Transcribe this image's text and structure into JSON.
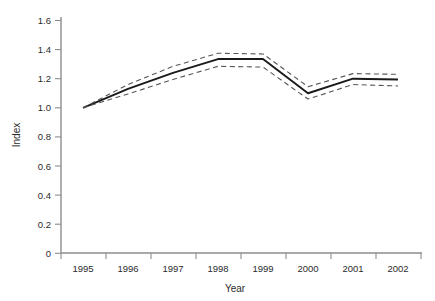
{
  "chart_data": {
    "type": "line",
    "title": "",
    "xlabel": "Year",
    "ylabel": "Index",
    "categories": [
      "1995",
      "1996",
      "1997",
      "1998",
      "1999",
      "2000",
      "2001",
      "2002"
    ],
    "x": [
      1995,
      1996,
      1997,
      1998,
      1999,
      2000,
      2001,
      2002
    ],
    "ylim": [
      0,
      1.6
    ],
    "yticks": [
      "0",
      "0.2",
      "0.4",
      "0.6",
      "0.8",
      "1.0",
      "1.2",
      "1.4",
      "1.6"
    ],
    "ytick_values": [
      0,
      0.2,
      0.4,
      0.6,
      0.8,
      1.0,
      1.2,
      1.4,
      1.6
    ],
    "grid": false,
    "legend": "none",
    "series": [
      {
        "name": "Index",
        "style": "solid",
        "color": "#1a1a1a",
        "values": [
          1.0,
          1.13,
          1.24,
          1.335,
          1.335,
          1.1,
          1.2,
          1.195
        ]
      },
      {
        "name": "Upper confidence limit",
        "style": "dashed",
        "color": "#555555",
        "values": [
          1.0,
          1.16,
          1.285,
          1.375,
          1.37,
          1.145,
          1.235,
          1.23
        ]
      },
      {
        "name": "Lower confidence limit",
        "style": "dashed",
        "color": "#555555",
        "values": [
          1.0,
          1.095,
          1.195,
          1.285,
          1.28,
          1.06,
          1.16,
          1.15
        ]
      }
    ]
  },
  "axes": {
    "y_title": "Index",
    "x_title": "Year",
    "y_labels": [
      "1.6",
      "1.4",
      "1.2",
      "1.0",
      "0.8",
      "0.6",
      "0.4",
      "0.2",
      "0"
    ],
    "x_labels": [
      "1995",
      "1996",
      "1997",
      "1998",
      "1999",
      "2000",
      "2001",
      "2002"
    ]
  }
}
